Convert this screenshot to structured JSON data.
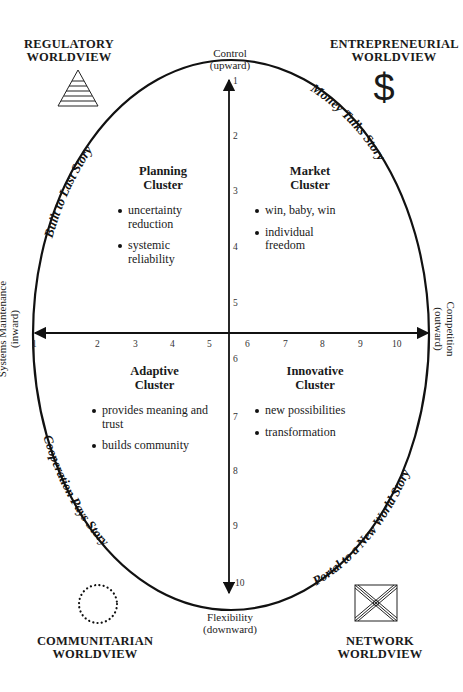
{
  "worldviews": {
    "top_left": {
      "line1": "REGULATORY",
      "line2": "WORLDVIEW",
      "icon": "pyramid-icon"
    },
    "top_right": {
      "line1": "ENTREPRENEURIAL",
      "line2": "WORLDVIEW",
      "icon": "dollar-icon",
      "symbol": "$"
    },
    "bottom_left": {
      "line1": "COMMUNITARIAN",
      "line2": "WORLDVIEW",
      "icon": "dotted-circle-icon"
    },
    "bottom_right": {
      "line1": "NETWORK",
      "line2": "WORLDVIEW",
      "icon": "network-box-icon"
    }
  },
  "axes": {
    "top": {
      "line1": "Control",
      "line2": "(upward)"
    },
    "bottom": {
      "line1": "Flexibility",
      "line2": "(downward)"
    },
    "left": {
      "line1": "Systems Maintenance",
      "line2": "(inward)"
    },
    "right": {
      "line1": "Competition",
      "line2": "(outward)"
    },
    "horizontal_ticks": [
      "1",
      "2",
      "3",
      "4",
      "5",
      "6",
      "7",
      "8",
      "9",
      "10"
    ],
    "vertical_ticks": [
      "1",
      "2",
      "3",
      "4",
      "5",
      "6",
      "7",
      "8",
      "9",
      "10"
    ]
  },
  "stories": {
    "top_left": "Built to Last Story",
    "top_right": "Money Talks Story",
    "bottom_left": "Cooperation Pays Story",
    "bottom_right": "Portal to a New World Story"
  },
  "clusters": {
    "planning": {
      "title1": "Planning",
      "title2": "Cluster",
      "bullets": [
        "uncertainty reduction",
        "systemic reliability"
      ]
    },
    "market": {
      "title1": "Market",
      "title2": "Cluster",
      "bullets": [
        "win, baby, win",
        "individual freedom"
      ]
    },
    "adaptive": {
      "title1": "Adaptive",
      "title2": "Cluster",
      "bullets": [
        "provides meaning and trust",
        "builds community"
      ]
    },
    "innovative": {
      "title1": "Innovative",
      "title2": "Cluster",
      "bullets": [
        "new possibilities",
        "transformation"
      ]
    }
  }
}
